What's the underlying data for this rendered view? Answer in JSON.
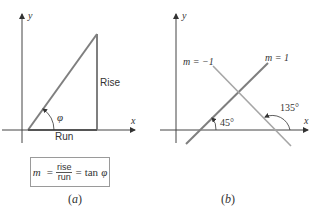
{
  "panel_a": {
    "axis_x_label": "x",
    "axis_y_label": "y",
    "rise_label": "Rise",
    "run_label": "Run",
    "angle_label": "φ",
    "formula": {
      "lhs": "m",
      "eq1": "=",
      "numerator": "rise",
      "denominator": "run",
      "eq2": "=",
      "rhs_fn": "tan",
      "rhs_var": "φ"
    },
    "caption_open": "(",
    "caption_letter": "a",
    "caption_close": ")"
  },
  "panel_b": {
    "axis_x_label": "x",
    "axis_y_label": "y",
    "line_pos_label": "m = 1",
    "line_neg_label": "m = −1",
    "angle_pos_label": "45°",
    "angle_neg_label": "135°",
    "caption_open": "(",
    "caption_letter": "b",
    "caption_close": ")"
  },
  "colors": {
    "axis": "#333333",
    "line": "#7f7f7f",
    "line_neg": "#a6a6a6",
    "text": "#333333"
  }
}
